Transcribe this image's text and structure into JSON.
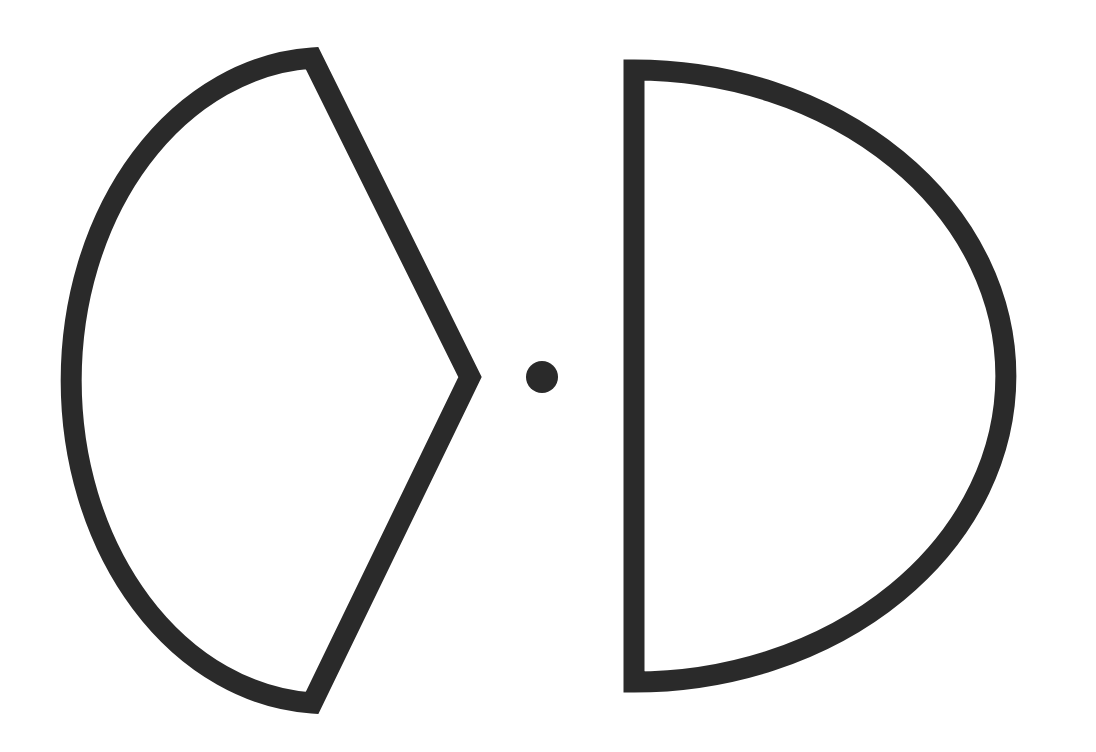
{
  "document": {
    "title": "Abstract Line Drawing",
    "width": 1096,
    "height": 752,
    "background_color": "#ffffff",
    "stroke_color": "#2a2a2a",
    "fill_color": "none",
    "description": "Two large open outline shapes with a small solid dot between them"
  },
  "figure": {
    "stroke_width": 21,
    "stroke_linecap": "butt",
    "stroke_linejoin": "miter",
    "shapes": [
      {
        "name": "left-pointed-oval",
        "label": "Left pointed-oval shape",
        "kind": "closed-outline",
        "fill": "none",
        "stroke": "#2a2a2a",
        "stroke_width": 21,
        "vertices": {
          "top": [
            312,
            58
          ],
          "bottom": [
            312,
            703
          ],
          "left_extreme": [
            57,
            377
          ],
          "right_point": [
            470,
            377
          ]
        },
        "arc": {
          "rx": 255,
          "ry": 323,
          "sweep": "left-bulging",
          "from": [
            312,
            58
          ],
          "to": [
            312,
            703
          ]
        },
        "path": "M 312 58 A 255 323 0 0 0 312 703 L 470 377 Z"
      },
      {
        "name": "right-d-shape",
        "label": "Right D shape",
        "kind": "closed-outline",
        "fill": "none",
        "stroke": "#2a2a2a",
        "stroke_width": 21,
        "vertices": {
          "top_left": [
            634,
            70
          ],
          "bottom_left": [
            634,
            682
          ],
          "right_extreme": [
            1006,
            376
          ]
        },
        "arc": {
          "rx": 372,
          "ry": 306,
          "sweep": "right-bulging",
          "from": [
            634,
            70
          ],
          "to": [
            634,
            682
          ]
        },
        "path": "M 634 70 L 634 682 A 372 306 0 0 0 634 70 Z"
      },
      {
        "name": "center-dot",
        "label": "Center dot",
        "kind": "filled-circle",
        "fill": "#2a2a2a",
        "stroke": "none",
        "center": [
          542,
          377
        ],
        "radius": 16
      }
    ]
  },
  "chart_data": {
    "type": "scatter",
    "title": "",
    "xlabel": "",
    "ylabel": "",
    "xlim": [
      0,
      1096
    ],
    "ylim": [
      0,
      752
    ],
    "grid": false,
    "legend": "none",
    "annotations": [
      "left pointed-oval outline",
      "solid center dot",
      "right D-shaped outline"
    ]
  }
}
